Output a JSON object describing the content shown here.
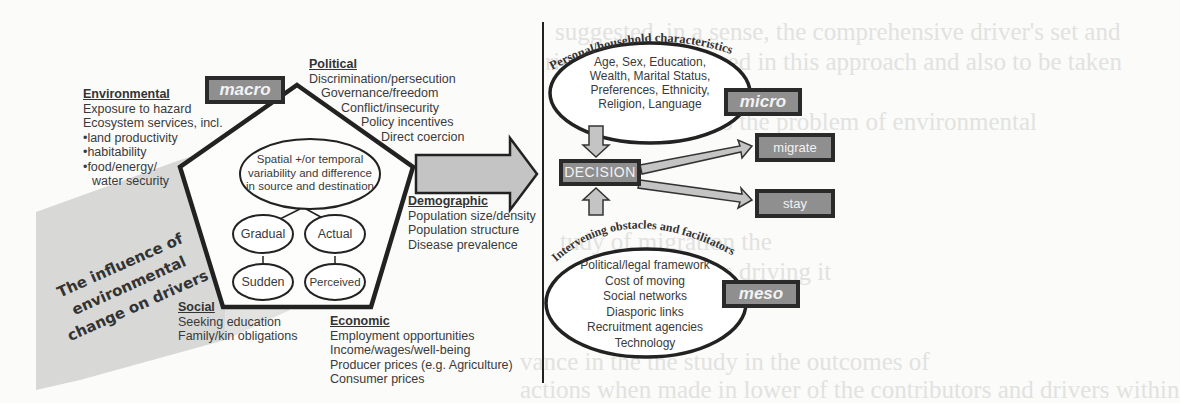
{
  "background_bleed": [
    "suggested, in a sense, the comprehensive driver's set and",
    "ries to be considered in this approach and also to be taken",
    "neatly the outcome of",
    "responses to the problem of environmental",
    "ountries should",
    "(e.g.",
    "tudy of migration the",
    "the situations driving it",
    "to understand how it could be possible to address",
    "vance in the the study in the outcomes of",
    "actions when made in lower of the contributors and drivers within"
  ],
  "left": {
    "influence_label": [
      "The influence of",
      "environmental",
      "change on drivers"
    ],
    "macro_label": "macro",
    "center_ellipse": [
      "Spatial +/or temporal",
      "variability and difference",
      "in source and destination"
    ],
    "ovals": [
      "Gradual",
      "Actual",
      "Sudden",
      "Perceived"
    ],
    "environmental": {
      "title": "Environmental",
      "items": [
        "Exposure to hazard",
        "Ecosystem services, incl.",
        "•land productivity",
        "•habitability",
        "•food/energy/",
        "  water security"
      ]
    },
    "political": {
      "title": "Political",
      "items": [
        "Discrimination/persecution",
        "Governance/freedom",
        "Conflict/insecurity",
        "Policy incentives",
        "Direct coercion"
      ]
    },
    "demographic": {
      "title": "Demographic",
      "items": [
        "Population size/density",
        "Population structure",
        "Disease prevalence"
      ]
    },
    "social": {
      "title": "Social",
      "items": [
        "Seeking education",
        "Family/kin obligations"
      ]
    },
    "economic": {
      "title": "Economic",
      "items": [
        "Employment opportunities",
        "Income/wages/well-being",
        "Producer prices (e.g. Agriculture)",
        "Consumer prices"
      ]
    }
  },
  "right": {
    "personal_arc_label": "Personal/household characteristics",
    "personal_items": [
      "Age, Sex, Education,",
      "Wealth, Marital Status,",
      "Preferences, Ethnicity,",
      "Religion, Language"
    ],
    "micro_label": "micro",
    "decision_label": "DECISION",
    "migrate_label": "migrate",
    "stay_label": "stay",
    "intervening_arc_label": "Intervening obstacles and facilitators",
    "intervening_items": [
      "Political/legal framework",
      "Cost of moving",
      "Social networks",
      "Diasporic links",
      "Recruitment agencies",
      "Technology"
    ],
    "meso_label": "meso"
  },
  "colors": {
    "box_fill": "#8f8f8f",
    "box_border": "#2a2a2a",
    "arrow_fill": "#c4c4c4",
    "shade": "#d6d6d4",
    "line": "#222222"
  }
}
